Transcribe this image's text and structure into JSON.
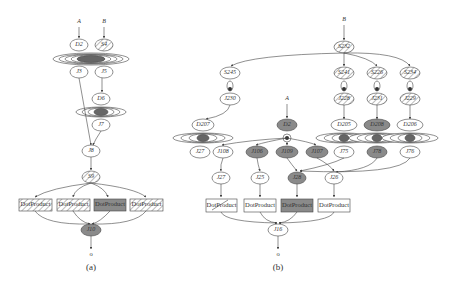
{
  "figure_a": {
    "caption": "(a)",
    "inputs": [
      "A",
      "B"
    ],
    "nodes": {
      "d2": "D2",
      "s4": "S4",
      "j3": "J3",
      "j5": "J5",
      "d6": "D6",
      "j7": "J7",
      "j8": "J8",
      "s9": "S9",
      "j10": "J10"
    },
    "products": [
      "DotProduct",
      "DotProduct",
      "DotProduct",
      "DotProduct"
    ],
    "output": "o"
  },
  "figure_b": {
    "caption": "(b)",
    "inputs": [
      "A",
      "B"
    ],
    "nodes": {
      "s232": "S232",
      "s245": "S245",
      "j230": "J230",
      "d207": "D207",
      "s241": "S241",
      "s226": "S226",
      "s234": "S234",
      "j228": "J228",
      "j231": "J231",
      "j229": "J229",
      "d205": "D205",
      "d208": "D208",
      "d206": "D206",
      "d2": "D2",
      "j27": "J27",
      "j108": "J108",
      "j106": "J106",
      "j109": "J109",
      "j107": "J107",
      "j75": "J75",
      "j78": "J78",
      "j76": "J76",
      "j25": "J25",
      "j28": "J28",
      "j26": "J26",
      "j16": "J16"
    },
    "products": [
      "DotProduct",
      "DotProduct",
      "DotProduct",
      "DotProduct"
    ],
    "output": "o"
  },
  "colors": {
    "shaded": "#8a8a8a",
    "stroke": "#444444",
    "hatch": "#555555"
  }
}
